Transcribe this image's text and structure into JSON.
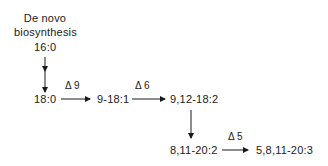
{
  "diagram": {
    "title_line1": "De novo",
    "title_line2": "biosynthesis",
    "nodes": {
      "c16_0": "16:0",
      "c18_0": "18:0",
      "c18_1": "9-18:1",
      "c18_2": "9,12-18:2",
      "c20_2": "8,11-20:2",
      "c20_3": "5,8,11-20:3"
    },
    "enzymes": {
      "d9": "Δ 9",
      "d6": "Δ 6",
      "d5": "Δ 5"
    },
    "edges": [
      {
        "from": "16:0",
        "to": "18:0",
        "label": ""
      },
      {
        "from": "18:0",
        "to": "9-18:1",
        "label": "Δ 9"
      },
      {
        "from": "9-18:1",
        "to": "9,12-18:2",
        "label": "Δ 6"
      },
      {
        "from": "9,12-18:2",
        "to": "8,11-20:2",
        "label": ""
      },
      {
        "from": "8,11-20:2",
        "to": "5,8,11-20:3",
        "label": "Δ 5"
      }
    ]
  }
}
